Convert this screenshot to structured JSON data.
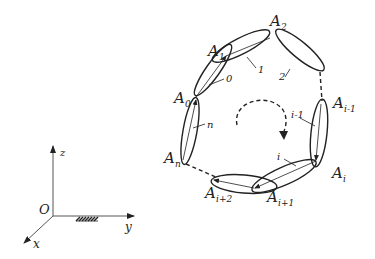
{
  "diagram": {
    "type": "closed kinematic chain with coordinate frame",
    "colors": {
      "stroke": "#222222",
      "background": "#ffffff"
    },
    "joints": [
      {
        "id": "A0",
        "base": "A",
        "sub": "0"
      },
      {
        "id": "A1",
        "base": "A",
        "sub": "1"
      },
      {
        "id": "A2",
        "base": "A",
        "sub": "2"
      },
      {
        "id": "Ai-1",
        "base": "A",
        "sub": "i-1"
      },
      {
        "id": "Ai",
        "base": "A",
        "sub": "i"
      },
      {
        "id": "Ai+1",
        "base": "A",
        "sub": "i+1"
      },
      {
        "id": "Ai+2",
        "base": "A",
        "sub": "i+2"
      },
      {
        "id": "An",
        "base": "A",
        "sub": "n"
      }
    ],
    "links": [
      {
        "label": "0"
      },
      {
        "label": "1"
      },
      {
        "label": "2"
      },
      {
        "label": "i-1"
      },
      {
        "label": "i"
      },
      {
        "label": "n"
      }
    ],
    "axes": {
      "origin": "O",
      "x": "x",
      "y": "y",
      "z": "z"
    }
  }
}
